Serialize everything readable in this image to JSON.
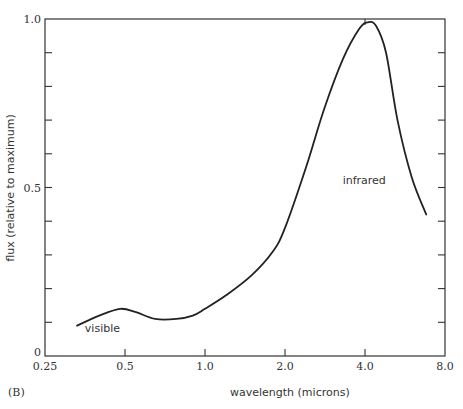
{
  "figure": {
    "panel_label": "(B)"
  },
  "chart_data": {
    "type": "line",
    "title": "",
    "xlabel": "wavelength (microns)",
    "ylabel": "flux (relative to maximum)",
    "x_scale": "log2",
    "xlim": [
      0.25,
      8.0
    ],
    "ylim": [
      0,
      1.0
    ],
    "x_tick_labels": [
      "0.25",
      "0.5",
      "1.0",
      "2.0",
      "4.0",
      "8.0"
    ],
    "x_ticks": [
      0.25,
      0.5,
      1.0,
      2.0,
      4.0,
      8.0
    ],
    "y_tick_labels": [
      "0",
      "0.5",
      "1.0"
    ],
    "y_ticks": [
      0,
      0.5,
      1.0
    ],
    "y_minor_ticks": [
      0.1,
      0.2,
      0.3,
      0.4,
      0.6,
      0.7,
      0.8,
      0.9
    ],
    "grid": false,
    "legend": null,
    "annotations": [
      {
        "text": "visible",
        "x": 0.45,
        "y": 0.08
      },
      {
        "text": "infrared",
        "x": 4.2,
        "y": 0.52
      }
    ],
    "series": [
      {
        "name": "flux",
        "x": [
          0.33,
          0.4,
          0.48,
          0.55,
          0.65,
          0.78,
          0.9,
          1.0,
          1.2,
          1.5,
          1.8,
          2.0,
          2.4,
          2.8,
          3.3,
          3.8,
          4.1,
          4.4,
          4.8,
          5.3,
          6.0,
          6.8
        ],
        "y": [
          0.09,
          0.12,
          0.14,
          0.13,
          0.11,
          0.11,
          0.12,
          0.14,
          0.18,
          0.24,
          0.31,
          0.38,
          0.56,
          0.73,
          0.88,
          0.97,
          0.99,
          0.98,
          0.9,
          0.7,
          0.53,
          0.42
        ]
      }
    ]
  }
}
